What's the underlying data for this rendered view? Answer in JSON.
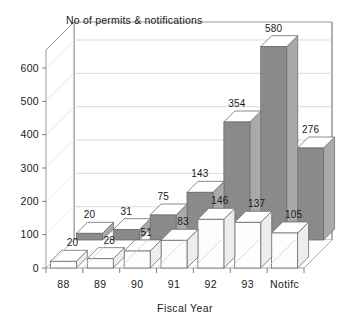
{
  "chart_data": {
    "type": "bar",
    "title": "No of permits & notifications",
    "xlabel": "Fiscal Year",
    "ylabel": "",
    "categories": [
      "88",
      "89",
      "90",
      "91",
      "92",
      "93",
      "Notifc"
    ],
    "series": [
      {
        "name": "back-series",
        "values": [
          20,
          31,
          75,
          143,
          354,
          580,
          276
        ],
        "color": "#8a8a8a"
      },
      {
        "name": "front-series",
        "values": [
          20,
          28,
          51,
          83,
          146,
          137,
          105
        ],
        "color": "#fdfdfd"
      }
    ],
    "ylim": [
      0,
      600
    ],
    "yticks": [
      0,
      100,
      200,
      300,
      400,
      500,
      600
    ],
    "ytick_labels": [
      "0",
      "100",
      "200",
      "300",
      "400",
      "500",
      "600"
    ],
    "grid": true,
    "legend": "none",
    "projection": "3d-two-row"
  },
  "colors": {
    "back_bar_fill": "#8a8a8a",
    "back_bar_top": "#ffffff",
    "front_bar_fill": "#fdfdfd",
    "front_bar_top": "#ffffff",
    "outline": "#6d6d6d",
    "grid": "#cfcfcf",
    "frame": "#8c8c8c",
    "text": "#1a1a1a",
    "background": "#ffffff"
  }
}
